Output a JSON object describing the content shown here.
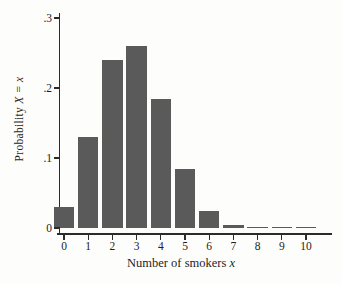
{
  "chart_data": {
    "type": "bar",
    "title": "",
    "xlabel": "Number of smokers x",
    "xlabel_prefix": "Number of smokers",
    "xlabel_var": "x",
    "ylabel": "Probability X = x",
    "ylabel_prefix": "Probability",
    "ylabel_var": "X = x",
    "categories": [
      "0",
      "1",
      "2",
      "3",
      "4",
      "5",
      "6",
      "7",
      "8",
      "9",
      "10"
    ],
    "values": [
      0.03,
      0.13,
      0.24,
      0.26,
      0.185,
      0.085,
      0.025,
      0.005,
      0.002,
      0.001,
      0.0005
    ],
    "ylim": [
      0,
      0.3
    ],
    "yticks": [
      0,
      0.1,
      0.2,
      0.3
    ],
    "ytick_labels": [
      "0",
      ".1",
      ".2",
      ".3"
    ],
    "grid": false,
    "legend": "none",
    "bar_color": "#5a5a5a",
    "axis_color": "#2b2b2b",
    "background_color": "#fdfdfc"
  }
}
